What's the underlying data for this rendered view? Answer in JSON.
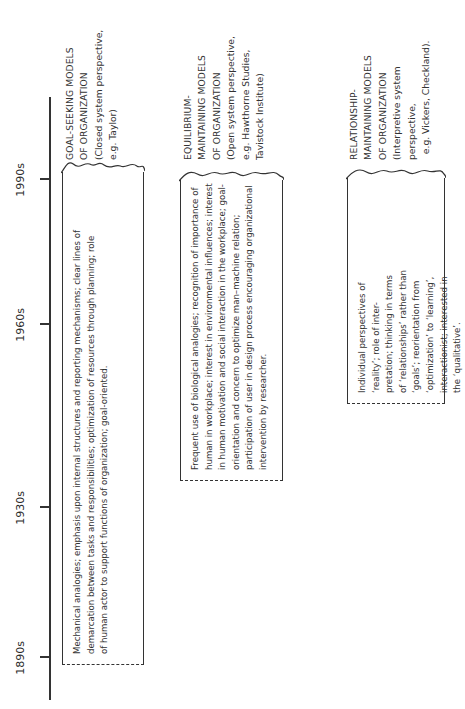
{
  "timeline": {
    "ticks": [
      {
        "label": "1890s",
        "pos": 51
      },
      {
        "label": "1930s",
        "pos": 201
      },
      {
        "label": "1960s",
        "pos": 384
      },
      {
        "label": "1990s",
        "pos": 529
      }
    ]
  },
  "models": [
    {
      "heading_lines": [
        "GOAL-SEEKING MODELS",
        "OF ORGANIZATION",
        "(Closed system perspective,",
        "e.g. Taylor)"
      ],
      "description_lines": [
        "Mechanical analogies; emphasis upon internal structures and reporting mechanisms; clear lines of",
        "demarcation between tasks and responsibilities; optimization of resources through planning; role",
        "of human actor to support functions of organization; goal-oriented."
      ]
    },
    {
      "heading_lines": [
        "EQUILIBRIUM-",
        "MAINTAINING MODELS",
        "OF ORGANIZATION",
        "(Open system perspective,",
        "e.g. Hawthorne Studies,",
        "Tavistock Institute)"
      ],
      "description_lines": [
        "Frequent use of biological analogies; recognition of importance of",
        "human in workplace; interest in environmental influences; interest",
        "in human motivation and social interaction in the workplace; goal-",
        "orientation and concern to optimize man–machine relation;",
        "participation of user in design process encouraging organizational",
        "intervention by researcher."
      ]
    },
    {
      "heading_lines": [
        "RELATIONSHIP-",
        "MAINTAINING MODELS",
        "OF ORGANIZATION",
        "(Interpretive system",
        "perspective,",
        "  e.g. Vickers, Checkland)."
      ],
      "description_lines": [
        "Individual perspectives of",
        "‘reality’; role  of inter-",
        "pretation; thinking in terms",
        "of ‘relationships’ rather than",
        "‘goals’; reorientation from",
        "‘optimization’ to ‘learning’,",
        "interactionist; interested in",
        "the ‘qualitative’."
      ]
    }
  ]
}
